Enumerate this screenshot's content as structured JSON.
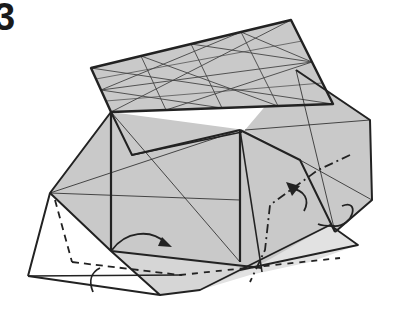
{
  "step": {
    "number": "3"
  },
  "colors": {
    "paper_gray": "#c9c9c9",
    "paper_light": "#e2e2e2",
    "paper_white": "#ffffff",
    "line": "#222222",
    "crease": "#444444"
  },
  "diagram": {
    "fills": [
      {
        "name": "right-wing",
        "points": "245,130 296,70 370,120 372,200 335,232 300,160",
        "fill": "#c9c9c9"
      },
      {
        "name": "main-body",
        "points": "50,193 111,112 245,130 300,160 335,232 260,270 200,272 111,251",
        "fill": "#c9c9c9"
      },
      {
        "name": "left-flap-white",
        "points": "28,276 50,193 111,251",
        "fill": "#ffffff"
      },
      {
        "name": "bottom-strip-white",
        "points": "28,276 111,251 160,295 100,290",
        "fill": "#ffffff"
      },
      {
        "name": "bottom-gray-strip",
        "points": "111,251 260,270 200,290 160,295",
        "fill": "#d6d6d6"
      },
      {
        "name": "right-lower-flap",
        "points": "200,290 265,262 330,225 358,245 310,262 250,275",
        "fill": "#e2e2e2"
      },
      {
        "name": "top-rectangle",
        "points": "91,68 291,20 333,104 111,112",
        "fill": "#c9c9c9"
      }
    ],
    "lines": [
      {
        "d": "M91,68 L291,20 L333,104 L111,112 Z",
        "w": 2.4
      },
      {
        "d": "M111,112 L50,193 L28,276",
        "w": 2
      },
      {
        "d": "M50,193 L111,251 L160,295 L28,276",
        "w": 2
      },
      {
        "d": "M111,112 L111,251",
        "w": 2.2
      },
      {
        "d": "M111,112 L132,155 L240,130",
        "w": 2
      },
      {
        "d": "M132,155 L242,132",
        "w": 1.4
      },
      {
        "d": "M240,130 L240,262",
        "w": 2.2
      },
      {
        "d": "M240,130 L262,272",
        "w": 1.6
      },
      {
        "d": "M240,130 L300,160 L335,232",
        "w": 2
      },
      {
        "d": "M296,70 L370,120 L372,200 L335,232",
        "w": 2
      },
      {
        "d": "M111,251 L262,268",
        "w": 2
      },
      {
        "d": "M160,295 L200,290 L330,225 L358,245 L240,270",
        "w": 1.8
      },
      {
        "d": "M28,276 L182,275",
        "w": 1.4
      },
      {
        "d": "M50,193 L240,200",
        "w": 0.8
      },
      {
        "d": "M111,112 L240,262",
        "w": 0.8
      },
      {
        "d": "M240,130 L50,193",
        "w": 0.8
      },
      {
        "d": "M300,160 L372,200",
        "w": 0.8
      },
      {
        "d": "M245,130 L370,120",
        "w": 0.8
      },
      {
        "d": "M296,70 L335,232",
        "w": 0.8
      }
    ],
    "grid_creases": [
      {
        "d": "M101,90 L312,62",
        "w": 0.9
      },
      {
        "d": "M91,68 L333,104",
        "w": 0.9
      },
      {
        "d": "M291,20 L111,112",
        "w": 0.9
      },
      {
        "d": "M191,44 L222,108",
        "w": 0.9
      },
      {
        "d": "M141,56 L166,110",
        "w": 0.9
      },
      {
        "d": "M241,32 L278,106",
        "w": 0.9
      },
      {
        "d": "M141,56 L278,106",
        "w": 0.9
      },
      {
        "d": "M191,44 L312,62",
        "w": 0.9
      },
      {
        "d": "M241,32 L312,62",
        "w": 0.9
      },
      {
        "d": "M101,90 L241,32",
        "w": 0.9
      },
      {
        "d": "M101,90 L222,108",
        "w": 0.9
      },
      {
        "d": "M166,110 L312,62",
        "w": 0.9
      },
      {
        "d": "M96,79 L302,41",
        "w": 0.7
      },
      {
        "d": "M106,101 L322,83",
        "w": 0.7
      }
    ],
    "dashed_lines": [
      {
        "name": "valley-fold-left",
        "d": "M55,200 L72,262",
        "dash": "7,5"
      },
      {
        "name": "valley-fold-bottom",
        "d": "M72,262 L180,275",
        "dash": "7,5"
      },
      {
        "name": "valley-fold-right",
        "d": "M180,275 L340,258",
        "dash": "6,6"
      }
    ],
    "dashdot_lines": [
      {
        "name": "mountain-fold-right",
        "d": "M350,155 L318,170 L270,205 L265,250 L250,282",
        "dash": "9,4,2,4"
      }
    ],
    "arrows": [
      {
        "name": "arrow-valley-fold",
        "d": "M112,250 C125,232 150,228 166,243",
        "head": "162,237 172,247 158,246"
      },
      {
        "name": "arrow-left-hook",
        "d": "M93,292 C88,280 92,272 100,268",
        "head": ""
      },
      {
        "name": "arrow-mountain-fold",
        "d": "M304,211 C310,200 305,190 290,188",
        "head": "286,182 300,186 292,196"
      },
      {
        "name": "arrow-turn-over",
        "d": "M342,206 C360,198 354,227 334,226 C326,226 322,226 318,224",
        "head": ""
      }
    ]
  }
}
